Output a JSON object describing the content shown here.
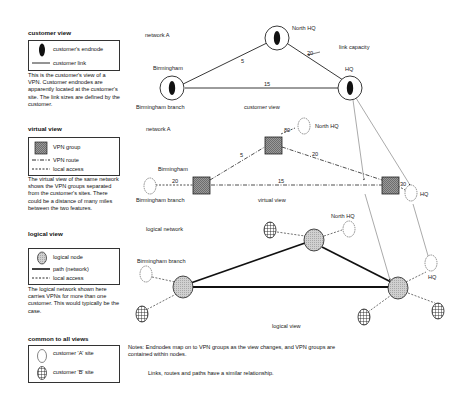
{
  "legend": {
    "customer_view": {
      "title": "customer view",
      "items": [
        {
          "icon": "endnode-icon",
          "label": "customer's endnode"
        },
        {
          "icon": "solid-line-icon",
          "label": "customer link"
        }
      ],
      "description": "This is the customer's view of a VPN.  Customer endnodes are apparently located at the customer's site.  The link sizes are defined by the customer."
    },
    "virtual_view": {
      "title": "virtual view",
      "items": [
        {
          "icon": "vpn-group-square-icon",
          "label": "VPN group"
        },
        {
          "icon": "dash-dot-line-icon",
          "label": "VPN route"
        },
        {
          "icon": "dashed-line-icon",
          "label": "local access"
        }
      ],
      "description": "The virtual view of the same network shows the VPN groups separated from the customer's sites.  There could be a distance of many miles between the two features."
    },
    "logical_view": {
      "title": "logical view",
      "items": [
        {
          "icon": "logical-node-icon",
          "label": "logical node"
        },
        {
          "icon": "thick-line-icon",
          "label": "path (network)"
        },
        {
          "icon": "dashed-line-icon",
          "label": "local access"
        }
      ],
      "description": "The logical network shown here carries VPNs for more than one customer.  This would typically be the case."
    },
    "common": {
      "title": "common to all views",
      "items": [
        {
          "icon": "customer-a-site-icon",
          "label": "customer 'A' site"
        },
        {
          "icon": "customer-b-site-icon",
          "label": "customer 'B' site"
        }
      ]
    }
  },
  "customer_view": {
    "network_label": "network A",
    "view_label": "customer view",
    "nodes": {
      "north_hq": "North HQ",
      "birmingham": "Birmingham",
      "birmingham_branch": "Birmingham branch",
      "hq": "HQ"
    },
    "links": {
      "birmingham_northhq": "5",
      "birmingham_hq": "15",
      "northhq_hq": "20"
    },
    "annotation": "link capacity"
  },
  "virtual_view": {
    "network_label": "network A",
    "view_label": "virtual view",
    "nodes": {
      "north_hq": "North HQ",
      "birmingham": "Birmingham",
      "birmingham_branch": "Birmingham branch",
      "hq": "HQ"
    },
    "links": {
      "branch_access": "20",
      "birm_mid": "5",
      "mid_northhq": "80",
      "mid_hq": "20",
      "birm_hq": "15",
      "hq_access": "30"
    }
  },
  "logical_view": {
    "network_label": "logical network",
    "view_label": "logical view",
    "nodes": {
      "birmingham_branch": "Birmingham branch",
      "north_hq": "North HQ",
      "hq": "HQ"
    }
  },
  "notes": {
    "line1": "Notes: Endnodes map on to VPN groups as the view changes, and VPN groups are contained within nodes.",
    "line2": "Links, routes and paths have a similar relationship."
  }
}
